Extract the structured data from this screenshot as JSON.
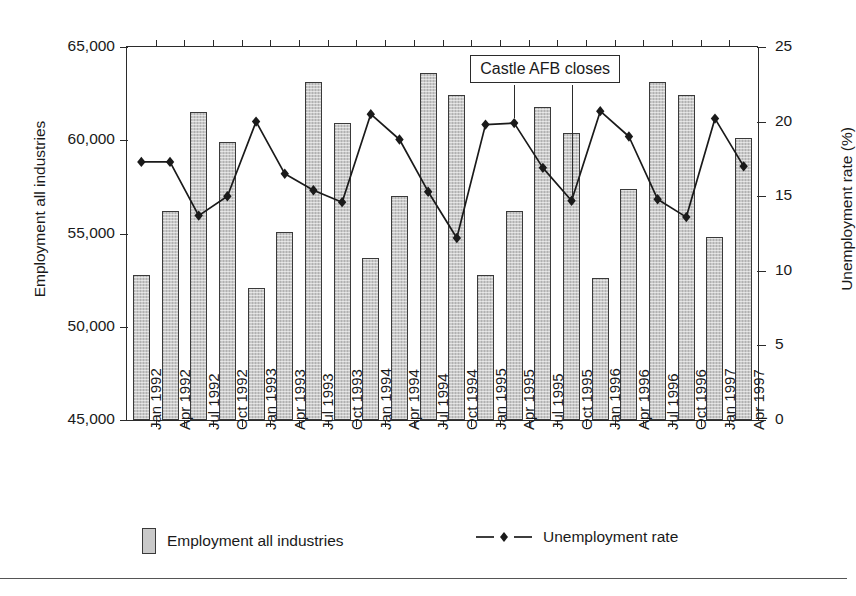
{
  "chart_data": {
    "type": "bar",
    "title": "",
    "xlabel": "",
    "ylabel": "Employment all industries",
    "y2label": "Unemployment rate (%)",
    "ylim": [
      45000,
      65000
    ],
    "y2lim": [
      0,
      25
    ],
    "yticks": [
      "45,000",
      "50,000",
      "55,000",
      "60,000",
      "65,000"
    ],
    "ytick_values": [
      45000,
      50000,
      55000,
      60000,
      65000
    ],
    "y2ticks": [
      "0",
      "5",
      "10",
      "15",
      "20",
      "25"
    ],
    "y2tick_values": [
      0,
      5,
      10,
      15,
      20,
      25
    ],
    "grid": false,
    "legend_position": "bottom",
    "categories": [
      "Jan 1992",
      "Apr 1992",
      "Jul 1992",
      "Oct 1992",
      "Jan 1993",
      "Apr 1993",
      "Jul 1993",
      "Oct 1993",
      "Jan 1994",
      "Apr 1994",
      "Jul 1994",
      "Oct 1994",
      "Jan 1995",
      "Apr 1995",
      "Jul 1995",
      "Oct 1995",
      "Jan 1996",
      "Apr 1996",
      "Jul 1996",
      "Oct 1996",
      "Jan 1997",
      "Apr 1997"
    ],
    "series": [
      {
        "name": "Employment all industries",
        "type": "bar",
        "axis": "left",
        "color": "#c9c9c9",
        "values": [
          52800,
          56200,
          61500,
          59900,
          52100,
          55100,
          63100,
          60900,
          53700,
          57000,
          63600,
          62400,
          52800,
          56200,
          61800,
          60400,
          52600,
          57400,
          63100,
          62400,
          54800,
          60100
        ]
      },
      {
        "name": "Unemployment rate",
        "type": "line",
        "axis": "right",
        "color": "#1a1a1a",
        "marker": "diamond",
        "values": [
          17.3,
          17.3,
          13.7,
          15.0,
          20.0,
          16.5,
          15.4,
          14.6,
          20.5,
          18.8,
          15.3,
          12.2,
          19.8,
          19.9,
          16.9,
          14.7,
          20.7,
          19.0,
          14.8,
          13.6,
          20.2,
          17.0
        ]
      }
    ],
    "annotations": [
      {
        "text": "Castle AFB closes",
        "leader_categories": [
          "Apr 1995",
          "Oct 1995"
        ]
      }
    ]
  },
  "legend": {
    "items": [
      {
        "label": "Employment all industries",
        "marker": "bar-swatch"
      },
      {
        "label": "Unemployment rate",
        "marker": "dashed-line-diamond"
      }
    ]
  }
}
